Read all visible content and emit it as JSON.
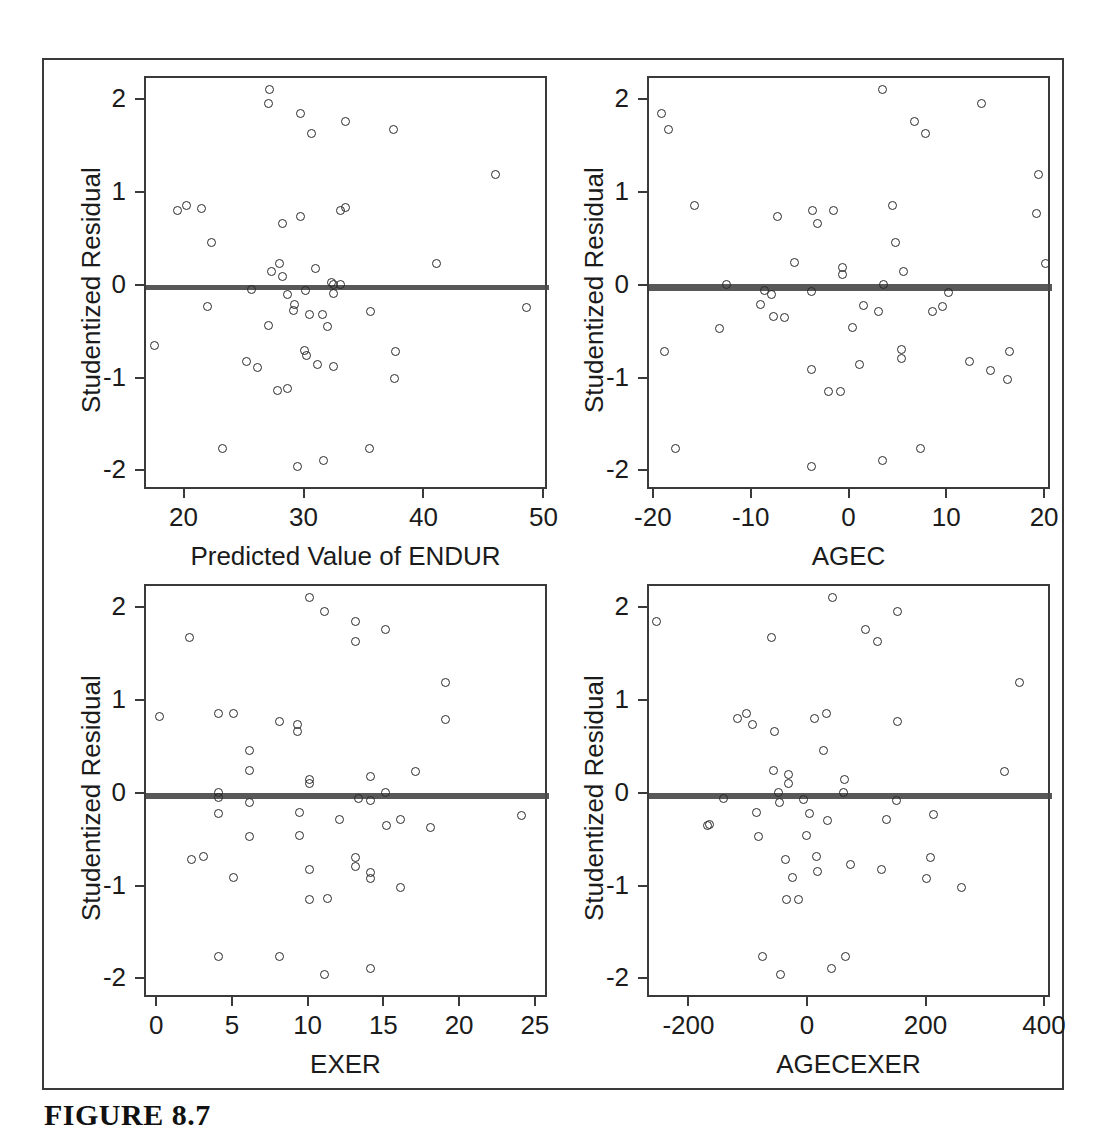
{
  "figure": {
    "caption": "FIGURE 8.7",
    "frame": {
      "x": 42,
      "y": 58,
      "w": 1022,
      "h": 1032
    }
  },
  "chart_data": [
    {
      "id": "panel-predicted-endur",
      "type": "scatter",
      "title": "",
      "xlabel": "Predicted Value of ENDUR",
      "ylabel": "Studentized Residual",
      "xlim": [
        16.7,
        50.3
      ],
      "ylim": [
        -2.2,
        2.25
      ],
      "xticks": [
        20,
        30,
        40,
        50
      ],
      "yticks": [
        2,
        1,
        0,
        -1,
        -2
      ],
      "grid": false,
      "legend": "none",
      "fit_line": {
        "y_left": 0.02,
        "y_right": 0.0
      },
      "points": [
        [
          27.0,
          2.13
        ],
        [
          26.9,
          1.97
        ],
        [
          29.6,
          1.87
        ],
        [
          33.3,
          1.78
        ],
        [
          30.5,
          1.65
        ],
        [
          37.3,
          1.69
        ],
        [
          45.8,
          1.21
        ],
        [
          19.3,
          0.82
        ],
        [
          20.1,
          0.88
        ],
        [
          21.3,
          0.84
        ],
        [
          32.9,
          0.82
        ],
        [
          33.3,
          0.86
        ],
        [
          29.6,
          0.76
        ],
        [
          28.1,
          0.68
        ],
        [
          22.2,
          0.48
        ],
        [
          27.8,
          0.25
        ],
        [
          27.2,
          0.17
        ],
        [
          28.1,
          0.11
        ],
        [
          30.8,
          0.2
        ],
        [
          40.9,
          0.25
        ],
        [
          32.3,
          0.02
        ],
        [
          32.9,
          0.03
        ],
        [
          32.2,
          0.05
        ],
        [
          25.5,
          -0.03
        ],
        [
          30.0,
          -0.04
        ],
        [
          28.5,
          -0.08
        ],
        [
          32.3,
          -0.07
        ],
        [
          29.1,
          -0.19
        ],
        [
          29.0,
          -0.26
        ],
        [
          30.3,
          -0.3
        ],
        [
          31.4,
          -0.3
        ],
        [
          35.4,
          -0.27
        ],
        [
          48.4,
          -0.22
        ],
        [
          21.8,
          -0.21
        ],
        [
          31.8,
          -0.43
        ],
        [
          26.9,
          -0.42
        ],
        [
          17.4,
          -0.63
        ],
        [
          29.9,
          -0.69
        ],
        [
          30.1,
          -0.74
        ],
        [
          37.5,
          -0.7
        ],
        [
          25.1,
          -0.8
        ],
        [
          26.0,
          -0.87
        ],
        [
          31.0,
          -0.84
        ],
        [
          32.3,
          -0.86
        ],
        [
          37.4,
          -0.99
        ],
        [
          27.7,
          -1.12
        ],
        [
          28.5,
          -1.1
        ],
        [
          23.1,
          -1.74
        ],
        [
          35.3,
          -1.74
        ],
        [
          31.5,
          -1.87
        ],
        [
          29.3,
          -1.94
        ]
      ]
    },
    {
      "id": "panel-agec",
      "type": "scatter",
      "title": "",
      "xlabel": "AGEC",
      "ylabel": "Studentized Residual",
      "xlim": [
        -20.6,
        20.6
      ],
      "ylim": [
        -2.2,
        2.25
      ],
      "xticks": [
        -20,
        -10,
        0,
        10,
        20
      ],
      "yticks": [
        2,
        1,
        0,
        -1,
        -2
      ],
      "grid": false,
      "legend": "none",
      "fit_line": {
        "y_left": 0.03,
        "y_right": -0.01
      },
      "points": [
        [
          3.3,
          2.13
        ],
        [
          13.4,
          1.97
        ],
        [
          -19.3,
          1.87
        ],
        [
          6.5,
          1.78
        ],
        [
          -18.6,
          1.7
        ],
        [
          7.7,
          1.65
        ],
        [
          19.2,
          1.21
        ],
        [
          4.3,
          0.88
        ],
        [
          -15.9,
          0.88
        ],
        [
          -3.9,
          0.82
        ],
        [
          -1.7,
          0.82
        ],
        [
          19.0,
          0.79
        ],
        [
          -7.5,
          0.76
        ],
        [
          -3.4,
          0.68
        ],
        [
          4.6,
          0.48
        ],
        [
          -5.7,
          0.26
        ],
        [
          -0.8,
          0.21
        ],
        [
          -0.8,
          0.13
        ],
        [
          5.4,
          0.16
        ],
        [
          19.9,
          0.25
        ],
        [
          -12.7,
          0.02
        ],
        [
          3.4,
          0.02
        ],
        [
          -8.8,
          -0.04
        ],
        [
          -4.0,
          -0.05
        ],
        [
          -8.1,
          -0.08
        ],
        [
          10.0,
          -0.06
        ],
        [
          -9.2,
          -0.19
        ],
        [
          1.3,
          -0.2
        ],
        [
          9.4,
          -0.21
        ],
        [
          8.4,
          -0.27
        ],
        [
          2.9,
          -0.27
        ],
        [
          -7.9,
          -0.32
        ],
        [
          -6.7,
          -0.33
        ],
        [
          -13.4,
          -0.45
        ],
        [
          0.2,
          -0.44
        ],
        [
          -19.0,
          -0.7
        ],
        [
          16.3,
          -0.7
        ],
        [
          5.2,
          -0.68
        ],
        [
          5.2,
          -0.77
        ],
        [
          12.2,
          -0.81
        ],
        [
          0.9,
          -0.84
        ],
        [
          -4.0,
          -0.89
        ],
        [
          14.3,
          -0.9
        ],
        [
          16.1,
          -1.0
        ],
        [
          -2.3,
          -1.13
        ],
        [
          -1.0,
          -1.13
        ],
        [
          -17.9,
          -1.74
        ],
        [
          7.2,
          -1.74
        ],
        [
          3.3,
          -1.87
        ],
        [
          -4.0,
          -1.94
        ]
      ]
    },
    {
      "id": "panel-exer",
      "type": "scatter",
      "title": "",
      "xlabel": "EXER",
      "ylabel": "Studentized Residual",
      "xlim": [
        -0.8,
        25.8
      ],
      "ylim": [
        -2.2,
        2.25
      ],
      "xticks": [
        0,
        5,
        10,
        15,
        20,
        25
      ],
      "yticks": [
        2,
        1,
        0,
        -1,
        -2
      ],
      "grid": false,
      "legend": "none",
      "fit_line": {
        "y_left": 0.02,
        "y_right": -0.01
      },
      "points": [
        [
          10.0,
          2.13
        ],
        [
          11.0,
          1.97
        ],
        [
          13.0,
          1.87
        ],
        [
          2.1,
          1.7
        ],
        [
          15.0,
          1.78
        ],
        [
          13.0,
          1.65
        ],
        [
          19.0,
          1.21
        ],
        [
          4.0,
          0.88
        ],
        [
          5.0,
          0.88
        ],
        [
          0.1,
          0.84
        ],
        [
          8.0,
          0.79
        ],
        [
          9.2,
          0.76
        ],
        [
          9.2,
          0.68
        ],
        [
          19.0,
          0.81
        ],
        [
          6.0,
          0.48
        ],
        [
          6.0,
          0.26
        ],
        [
          10.0,
          0.17
        ],
        [
          10.0,
          0.12
        ],
        [
          14.0,
          0.2
        ],
        [
          17.0,
          0.25
        ],
        [
          4.0,
          0.03
        ],
        [
          15.0,
          0.03
        ],
        [
          4.0,
          -0.03
        ],
        [
          13.2,
          -0.04
        ],
        [
          6.0,
          -0.08
        ],
        [
          14.0,
          -0.06
        ],
        [
          4.0,
          -0.2
        ],
        [
          9.3,
          -0.19
        ],
        [
          12.0,
          -0.27
        ],
        [
          16.0,
          -0.27
        ],
        [
          24.0,
          -0.22
        ],
        [
          15.1,
          -0.33
        ],
        [
          18.0,
          -0.35
        ],
        [
          6.0,
          -0.45
        ],
        [
          9.3,
          -0.44
        ],
        [
          2.2,
          -0.7
        ],
        [
          3.0,
          -0.66
        ],
        [
          13.0,
          -0.68
        ],
        [
          13.0,
          -0.77
        ],
        [
          14.0,
          -0.84
        ],
        [
          10.0,
          -0.81
        ],
        [
          5.0,
          -0.89
        ],
        [
          14.0,
          -0.9
        ],
        [
          16.0,
          -1.0
        ],
        [
          10.0,
          -1.13
        ],
        [
          11.2,
          -1.12
        ],
        [
          4.0,
          -1.74
        ],
        [
          8.0,
          -1.74
        ],
        [
          14.0,
          -1.87
        ],
        [
          11.0,
          -1.94
        ]
      ]
    },
    {
      "id": "panel-agecexer",
      "type": "scatter",
      "title": "",
      "xlabel": "AGECEXER",
      "ylabel": "Studentized Residual",
      "xlim": [
        -270,
        410
      ],
      "ylim": [
        -2.2,
        2.25
      ],
      "xticks": [
        -200,
        0,
        200,
        400
      ],
      "yticks": [
        2,
        1,
        0,
        -1,
        -2
      ],
      "grid": false,
      "legend": "none",
      "fit_line": {
        "y_left": 0.02,
        "y_right": -0.01
      },
      "points": [
        [
          40.0,
          2.13
        ],
        [
          150.0,
          1.97
        ],
        [
          -258.0,
          1.87
        ],
        [
          96.0,
          1.78
        ],
        [
          -64.0,
          1.7
        ],
        [
          116.0,
          1.65
        ],
        [
          355.0,
          1.21
        ],
        [
          -105.0,
          0.88
        ],
        [
          -120.0,
          0.82
        ],
        [
          10.0,
          0.82
        ],
        [
          30.0,
          0.88
        ],
        [
          150.0,
          0.79
        ],
        [
          -95.0,
          0.76
        ],
        [
          -58.0,
          0.68
        ],
        [
          25.0,
          0.48
        ],
        [
          -60.0,
          0.26
        ],
        [
          -35.0,
          0.22
        ],
        [
          -35.0,
          0.12
        ],
        [
          60.0,
          0.16
        ],
        [
          330.0,
          0.25
        ],
        [
          -52.0,
          0.03
        ],
        [
          58.0,
          0.02
        ],
        [
          -145.0,
          -0.04
        ],
        [
          -10.0,
          -0.05
        ],
        [
          -50.0,
          -0.08
        ],
        [
          148.0,
          -0.06
        ],
        [
          -88.0,
          -0.19
        ],
        [
          0.0,
          -0.2
        ],
        [
          210.0,
          -0.21
        ],
        [
          130.0,
          -0.27
        ],
        [
          32.0,
          -0.28
        ],
        [
          -168.0,
          -0.32
        ],
        [
          -172.0,
          -0.33
        ],
        [
          -85.0,
          -0.45
        ],
        [
          -5.0,
          -0.44
        ],
        [
          -40.0,
          -0.7
        ],
        [
          205.0,
          -0.68
        ],
        [
          12.0,
          -0.66
        ],
        [
          70.0,
          -0.75
        ],
        [
          122.0,
          -0.8
        ],
        [
          15.0,
          -0.83
        ],
        [
          -28.0,
          -0.89
        ],
        [
          198.0,
          -0.9
        ],
        [
          258.0,
          -1.0
        ],
        [
          -38.0,
          -1.13
        ],
        [
          -18.0,
          -1.13
        ],
        [
          -78.0,
          -1.74
        ],
        [
          62.0,
          -1.74
        ],
        [
          38.0,
          -1.87
        ],
        [
          -48.0,
          -1.94
        ]
      ]
    }
  ]
}
